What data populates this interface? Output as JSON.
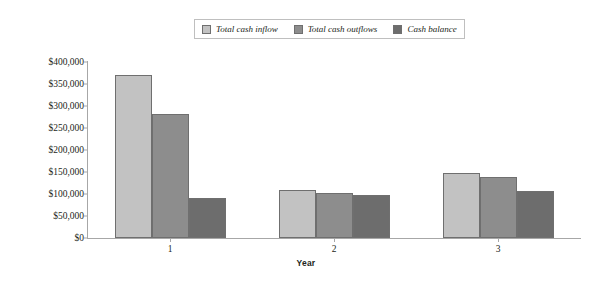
{
  "chart_data": {
    "type": "bar",
    "title": "",
    "xlabel": "Year",
    "ylabel": "",
    "categories": [
      "1",
      "2",
      "3"
    ],
    "series": [
      {
        "name": "Total cash inflow",
        "color": "#c2c2c2",
        "values": [
          370000,
          110000,
          148000
        ]
      },
      {
        "name": "Total cash outflows",
        "color": "#8d8d8d",
        "values": [
          282000,
          103000,
          138000
        ]
      },
      {
        "name": "Cash balance",
        "color": "#6d6d6d",
        "values": [
          90000,
          97000,
          107000
        ]
      }
    ],
    "ylim": [
      0,
      400000
    ],
    "ytick_values": [
      0,
      50000,
      100000,
      150000,
      200000,
      250000,
      300000,
      350000,
      400000
    ],
    "ytick_labels": [
      "$0",
      "$50,000",
      "$100,000",
      "$150,000",
      "$200,000",
      "$250,000",
      "$300,000",
      "$350,000",
      "$400,000"
    ],
    "grid": false,
    "legend_position": "top-center"
  },
  "legend": {
    "entries": [
      {
        "label": "Total cash inflow"
      },
      {
        "label": "Total cash outflows"
      },
      {
        "label": "Cash balance"
      }
    ]
  },
  "axis": {
    "x_title": "Year"
  }
}
